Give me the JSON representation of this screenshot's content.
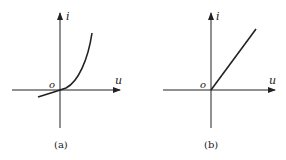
{
  "figures": [
    {
      "id": "a",
      "caption": "(a)",
      "x_axis_label": "u",
      "y_axis_label": "i",
      "origin_label": "o",
      "curve_type": "exponential",
      "description": "Nonlinear (diode-like) characteristic: small negative current for u<0, rising exponentially for u>0"
    },
    {
      "id": "b",
      "caption": "(b)",
      "x_axis_label": "u",
      "y_axis_label": "i",
      "origin_label": "o",
      "curve_type": "linear-rectifier",
      "description": "Ideal piecewise-linear characteristic: zero current for u<0, straight line through origin for u>0"
    }
  ],
  "colors": {
    "stroke": "#222222",
    "background": "#ffffff"
  }
}
